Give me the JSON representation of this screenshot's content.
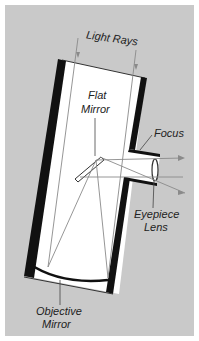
{
  "diagram": {
    "labels": {
      "light_rays": "Light Rays",
      "flat_mirror_line1": "Flat",
      "flat_mirror_line2": "Mirror",
      "focus": "Focus",
      "eyepiece_line1": "Eyepiece",
      "eyepiece_line2": "Lens",
      "objective_line1": "Objective",
      "objective_line2": "Mirror"
    },
    "colors": {
      "background": "#c9c9c9",
      "tube_wall": "#111111",
      "tube_interior": "#ffffff",
      "ray": "#8a8a8a",
      "leader_line": "#444444"
    }
  }
}
